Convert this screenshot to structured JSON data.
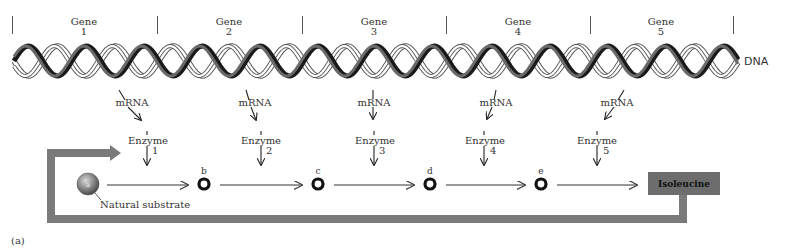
{
  "genes": [
    {
      "label": "Gene",
      "number": "1"
    },
    {
      "label": "Gene",
      "number": "2"
    },
    {
      "label": "Gene",
      "number": "3"
    },
    {
      "label": "Gene",
      "number": "4"
    },
    {
      "label": "Gene",
      "number": "5"
    }
  ],
  "dna_label": "DNA",
  "mrna": [
    {
      "label": "mRNA"
    },
    {
      "label": "mRNA"
    },
    {
      "label": "mRNA"
    },
    {
      "label": "mRNA"
    },
    {
      "label": "mRNA"
    }
  ],
  "enzymes": [
    {
      "label": "Enzyme",
      "number": "1"
    },
    {
      "label": "Enzyme",
      "number": "2"
    },
    {
      "label": "Enzyme",
      "number": "3"
    },
    {
      "label": "Enzyme",
      "number": "4"
    },
    {
      "label": "Enzyme",
      "number": "5"
    }
  ],
  "pathway": {
    "substrate": {
      "letter": "a",
      "label": "Natural substrate"
    },
    "intermediates": [
      "b",
      "c",
      "d",
      "e"
    ],
    "product": "Isoleucine"
  },
  "panel_label": "(a)",
  "colors": {
    "feedback_loop": "#7a7a7a",
    "product_box": "#6d6d6d",
    "helix_dark": "#1a1a1a",
    "helix_light": "#ffffff",
    "ring": "#111111"
  }
}
